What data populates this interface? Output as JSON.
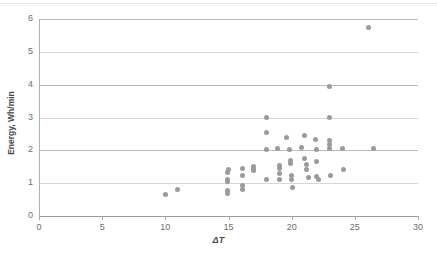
{
  "chart_data": {
    "type": "scatter",
    "title": "",
    "xlabel": "ΔT",
    "ylabel": "Energy, Wh/min",
    "xlim": [
      0,
      30
    ],
    "ylim": [
      0,
      6
    ],
    "xticks": [
      0,
      5,
      10,
      15,
      20,
      25,
      30
    ],
    "yticks": [
      0,
      1,
      2,
      3,
      4,
      5,
      6
    ],
    "grid": "horizontal",
    "legend": "none",
    "marker_color": "#9b9b9b",
    "gridline_color": "#b9b9b9",
    "axis_color": "#a8a8a8",
    "tick_label_color": "#6d6d6d",
    "series": [
      {
        "name": "Energy vs ΔT",
        "points": [
          [
            10.0,
            0.65
          ],
          [
            11.0,
            0.82
          ],
          [
            14.9,
            1.32
          ],
          [
            14.9,
            1.12
          ],
          [
            14.9,
            1.05
          ],
          [
            14.9,
            0.78
          ],
          [
            14.9,
            0.7
          ],
          [
            15.0,
            1.42
          ],
          [
            16.1,
            1.45
          ],
          [
            16.1,
            1.22
          ],
          [
            16.1,
            0.92
          ],
          [
            16.1,
            0.8
          ],
          [
            17.0,
            1.52
          ],
          [
            17.0,
            1.48
          ],
          [
            17.0,
            1.42
          ],
          [
            17.0,
            1.38
          ],
          [
            18.0,
            3.0
          ],
          [
            18.0,
            2.55
          ],
          [
            18.0,
            2.02
          ],
          [
            18.0,
            1.1
          ],
          [
            18.9,
            2.05
          ],
          [
            19.0,
            1.55
          ],
          [
            19.0,
            1.45
          ],
          [
            19.0,
            1.3
          ],
          [
            19.0,
            1.12
          ],
          [
            19.6,
            2.4
          ],
          [
            19.8,
            2.02
          ],
          [
            19.9,
            1.7
          ],
          [
            19.9,
            1.6
          ],
          [
            20.0,
            1.22
          ],
          [
            20.0,
            1.12
          ],
          [
            20.1,
            0.88
          ],
          [
            20.8,
            2.08
          ],
          [
            21.0,
            2.45
          ],
          [
            21.0,
            1.75
          ],
          [
            21.2,
            1.58
          ],
          [
            21.2,
            1.42
          ],
          [
            21.3,
            1.18
          ],
          [
            21.9,
            2.32
          ],
          [
            22.0,
            2.02
          ],
          [
            22.0,
            1.65
          ],
          [
            22.0,
            1.2
          ],
          [
            22.1,
            1.1
          ],
          [
            23.0,
            3.95
          ],
          [
            23.0,
            3.0
          ],
          [
            23.0,
            2.3
          ],
          [
            23.0,
            2.18
          ],
          [
            23.0,
            2.05
          ],
          [
            23.1,
            1.22
          ],
          [
            24.0,
            2.05
          ],
          [
            24.1,
            1.42
          ],
          [
            26.1,
            5.75
          ],
          [
            26.5,
            2.05
          ]
        ]
      }
    ]
  },
  "axes": {
    "y_tick_labels": [
      "0",
      "1",
      "2",
      "3",
      "4",
      "5",
      "6"
    ],
    "x_tick_labels": [
      "0",
      "5",
      "10",
      "15",
      "20",
      "25",
      "30"
    ],
    "x_axis_title": "ΔT",
    "y_axis_title": "Energy, Wh/min"
  }
}
